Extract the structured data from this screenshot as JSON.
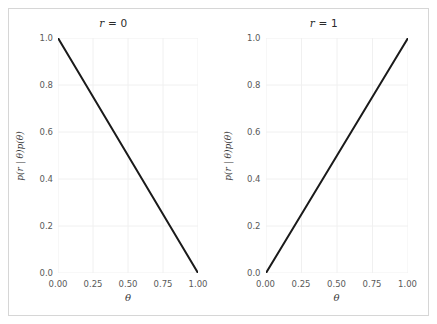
{
  "chart_data": {
    "type": "line",
    "title": "",
    "figure_layout": "1x2 side-by-side subplots",
    "grid": true,
    "legend": null,
    "panels": [
      {
        "title": "r = 0",
        "title_variable": "r",
        "title_value": "0",
        "xlabel": "θ",
        "ylabel": "p(r | θ)p(θ)",
        "xlim": [
          0.0,
          1.0
        ],
        "ylim": [
          0.0,
          1.0
        ],
        "xticks": [
          "0.00",
          "0.25",
          "0.50",
          "0.75",
          "1.00"
        ],
        "xtick_values": [
          0.0,
          0.25,
          0.5,
          0.75,
          1.0
        ],
        "yticks": [
          "0.0",
          "0.2",
          "0.4",
          "0.6",
          "0.8",
          "1.0"
        ],
        "ytick_values": [
          0.0,
          0.2,
          0.4,
          0.6,
          0.8,
          1.0
        ],
        "series": [
          {
            "name": "p(r=0 | θ)p(θ)",
            "color": "#1a1a1a",
            "x": [
              0.0,
              0.1,
              0.2,
              0.3,
              0.4,
              0.5,
              0.6,
              0.7,
              0.8,
              0.9,
              1.0
            ],
            "values": [
              1.0,
              0.9,
              0.8,
              0.7,
              0.6,
              0.5,
              0.4,
              0.3,
              0.2,
              0.1,
              0.0
            ]
          }
        ]
      },
      {
        "title": "r = 1",
        "title_variable": "r",
        "title_value": "1",
        "xlabel": "θ",
        "ylabel": "p(r | θ)p(θ)",
        "xlim": [
          0.0,
          1.0
        ],
        "ylim": [
          0.0,
          1.0
        ],
        "xticks": [
          "0.00",
          "0.25",
          "0.50",
          "0.75",
          "1.00"
        ],
        "xtick_values": [
          0.0,
          0.25,
          0.5,
          0.75,
          1.0
        ],
        "yticks": [
          "0.0",
          "0.2",
          "0.4",
          "0.6",
          "0.8",
          "1.0"
        ],
        "ytick_values": [
          0.0,
          0.2,
          0.4,
          0.6,
          0.8,
          1.0
        ],
        "series": [
          {
            "name": "p(r=1 | θ)p(θ)",
            "color": "#1a1a1a",
            "x": [
              0.0,
              0.1,
              0.2,
              0.3,
              0.4,
              0.5,
              0.6,
              0.7,
              0.8,
              0.9,
              1.0
            ],
            "values": [
              0.0,
              0.1,
              0.2,
              0.3,
              0.4,
              0.5,
              0.6,
              0.7,
              0.8,
              0.9,
              1.0
            ]
          }
        ]
      }
    ],
    "colors": {
      "line": "#1a1a1a",
      "grid": "#f0f0f0",
      "axis_text": "#5a5a5a",
      "label_text": "#3a3a3a",
      "frame": "#d6d6d6",
      "background": "#ffffff"
    }
  }
}
